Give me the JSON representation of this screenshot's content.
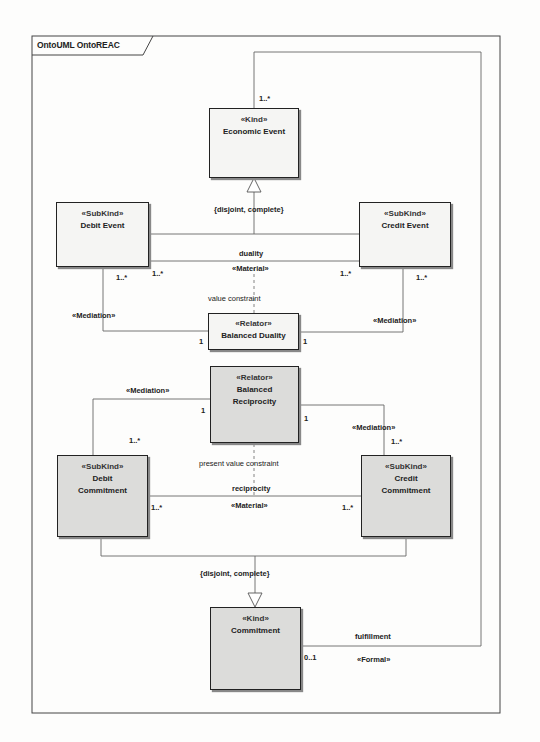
{
  "frame": {
    "title": "OntoUML OntoREAC"
  },
  "classes": {
    "economic_event": {
      "stereotype": "«Kind»",
      "name": "Economic Event"
    },
    "debit_event": {
      "stereotype": "«SubKind»",
      "name": "Debit Event"
    },
    "credit_event": {
      "stereotype": "«SubKind»",
      "name": "Credit Event"
    },
    "balanced_duality": {
      "stereotype": "«Relator»",
      "name": "Balanced Duality"
    },
    "balanced_reciprocity": {
      "stereotype": "«Relator»",
      "name": "Balanced Reciprocity",
      "name_line1": "Balanced",
      "name_line2": "Reciprocity"
    },
    "debit_commitment": {
      "stereotype": "«SubKind»",
      "name": "Debit Commitment",
      "name_line1": "Debit",
      "name_line2": "Commitment"
    },
    "credit_commitment": {
      "stereotype": "«SubKind»",
      "name": "Credit Commitment",
      "name_line1": "Credit",
      "name_line2": "Commitment"
    },
    "commitment": {
      "stereotype": "«Kind»",
      "name": "Commitment"
    }
  },
  "relations": {
    "event_generalization": {
      "constraint": "{disjoint, complete}"
    },
    "duality": {
      "name": "duality",
      "stereotype": "«Material»",
      "mult_left": "1..*",
      "mult_right": "1..*"
    },
    "value_constraint": {
      "label": "value constraint"
    },
    "duality_mediation_left": {
      "stereotype": "«Mediation»",
      "mult_subkind": "1..*",
      "mult_relator": "1"
    },
    "duality_mediation_right": {
      "stereotype": "«Mediation»",
      "mult_subkind": "1..*",
      "mult_relator": "1"
    },
    "reciprocity_mediation_left": {
      "stereotype": "«Mediation»",
      "mult_subkind": "1..*",
      "mult_relator": "1"
    },
    "reciprocity_mediation_right": {
      "stereotype": "«Mediation»",
      "mult_subkind": "1..*",
      "mult_relator": "1"
    },
    "present_value_constraint": {
      "label": "present value constraint"
    },
    "reciprocity": {
      "name": "reciprocity",
      "stereotype": "«Material»",
      "mult_left": "1..*",
      "mult_right": "1..*"
    },
    "commitment_generalization": {
      "constraint": "{disjoint, complete}"
    },
    "fulfillment": {
      "name": "fulfillment",
      "stereotype": "«Formal»",
      "mult_commitment": "0..1",
      "mult_event": "1..*"
    }
  },
  "colors": {
    "line": "#555555",
    "frame": "#444444",
    "box_white": "#f5f5f3",
    "box_gray": "#dcdcda"
  }
}
